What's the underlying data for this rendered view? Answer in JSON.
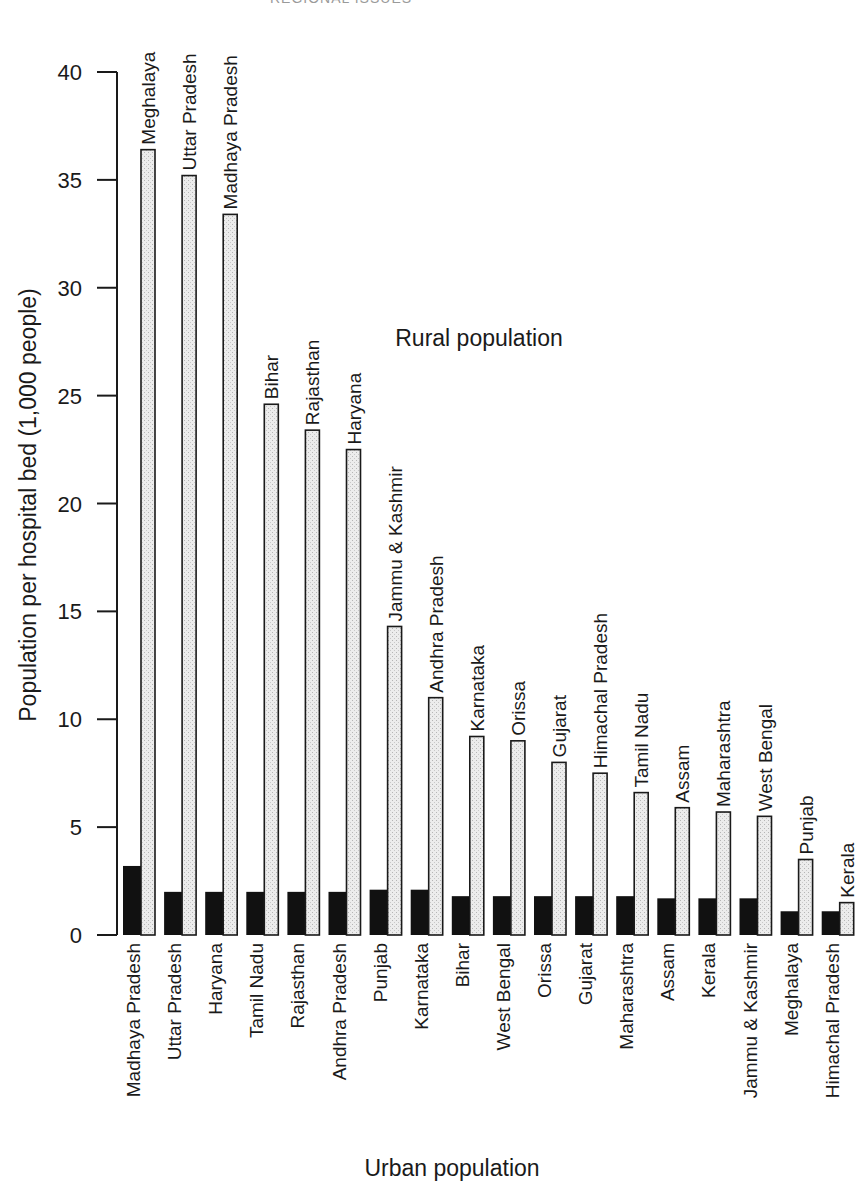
{
  "page_header_fragment": "REGIONAL ISSUES",
  "chart_data": {
    "type": "bar",
    "title": "",
    "ylabel": "Population per hospital bed (1,000 people)",
    "xlabel": "Urban population",
    "annotation": "Rural population",
    "ylim": [
      0,
      40
    ],
    "yticks": [
      0,
      5,
      10,
      15,
      20,
      25,
      30,
      35,
      40
    ],
    "grid": false,
    "legend_position": "none (series identified by text labels)",
    "series": [
      {
        "name": "Urban population",
        "style": "solid black bars, labelled below axis",
        "color": "#111111",
        "categories": [
          "Madhaya Pradesh",
          "Uttar Pradesh",
          "Haryana",
          "Tamil Nadu",
          "Rajasthan",
          "Andhra Pradesh",
          "Punjab",
          "Karnataka",
          "Bihar",
          "West Bengal",
          "Orissa",
          "Gujarat",
          "Maharashtra",
          "Assam",
          "Kerala",
          "Jammu & Kashmir",
          "Meghalaya",
          "Himachal Pradesh"
        ],
        "values": [
          3.2,
          2.0,
          2.0,
          2.0,
          2.0,
          2.0,
          2.1,
          2.1,
          1.8,
          1.8,
          1.8,
          1.8,
          1.8,
          1.7,
          1.7,
          1.7,
          1.1,
          1.1
        ]
      },
      {
        "name": "Rural population",
        "style": "light stippled bars with outline, labelled above bar",
        "color": "#e6e6e6",
        "categories": [
          "Meghalaya",
          "Uttar Pradesh",
          "Madhaya Pradesh",
          "Bihar",
          "Rajasthan",
          "Haryana",
          "Jammu & Kashmir",
          "Andhra Pradesh",
          "Karnataka",
          "Orissa",
          "Gujarat",
          "Himachal Pradesh",
          "Tamil Nadu",
          "Assam",
          "Maharashtra",
          "West Bengal",
          "Punjab",
          "Kerala"
        ],
        "values": [
          36.4,
          35.2,
          33.4,
          24.6,
          23.4,
          22.5,
          14.3,
          11.0,
          9.2,
          9.0,
          8.0,
          7.5,
          6.6,
          5.9,
          5.7,
          5.5,
          3.5,
          1.5
        ]
      }
    ]
  }
}
